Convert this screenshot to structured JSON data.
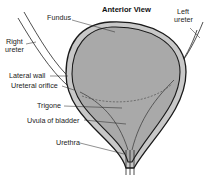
{
  "diagram": {
    "title": "Anterior View",
    "labels": {
      "fundus": "Fundus",
      "left_ureter_1": "Left",
      "left_ureter_2": "ureter",
      "right_ureter_1": "Right",
      "right_ureter_2": "ureter",
      "lateral_wall": "Lateral wall",
      "ureteral_orifice": "Ureteral orifice",
      "trigone": "Trigone",
      "uvula": "Uvula of bladder",
      "urethra": "Urethra"
    },
    "colors": {
      "lumen": "#a9a9a9",
      "wall": "#c8c8c8",
      "outline": "#1a1a1a",
      "background": "#ffffff"
    }
  }
}
